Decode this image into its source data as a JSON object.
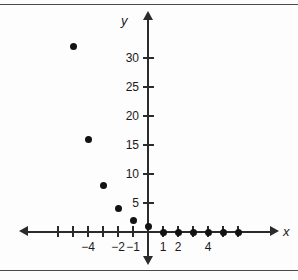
{
  "figure": {
    "x_axis_label": "x",
    "y_axis_label": "y",
    "background_color": "#fdfdfd",
    "point_color": "#121212",
    "axis_color": "#2b2b2b"
  },
  "chart_data": {
    "type": "scatter",
    "title": "",
    "xlabel": "x",
    "ylabel": "y",
    "grid": false,
    "legend": null,
    "xlim": [
      -7,
      7
    ],
    "ylim": [
      -2,
      34
    ],
    "x_tick_values": [
      -6,
      -5,
      -4,
      -3,
      -2,
      -1,
      1,
      2,
      3,
      4,
      5,
      6
    ],
    "x_tick_labels": [
      "",
      "",
      "-4",
      "",
      "-2",
      "-1",
      "1",
      "2",
      "",
      "4",
      "",
      ""
    ],
    "x_labeled_ticks": [
      {
        "value": -4,
        "label": "−4"
      },
      {
        "value": -2,
        "label": "−2"
      },
      {
        "value": -1,
        "label": "−1"
      },
      {
        "value": 1,
        "label": "1"
      },
      {
        "value": 2,
        "label": "2"
      },
      {
        "value": 4,
        "label": "4"
      }
    ],
    "y_tick_values": [
      5,
      10,
      15,
      20,
      25,
      30
    ],
    "y_tick_labels": [
      "5",
      "10",
      "15",
      "20",
      "25",
      "30"
    ],
    "points": [
      {
        "x": -5,
        "y": 32
      },
      {
        "x": -4,
        "y": 16
      },
      {
        "x": -3,
        "y": 8
      },
      {
        "x": -2,
        "y": 4
      },
      {
        "x": -1,
        "y": 2
      },
      {
        "x": 0,
        "y": 1
      },
      {
        "x": 1,
        "y": 0
      },
      {
        "x": 2,
        "y": 0
      },
      {
        "x": 3,
        "y": 0
      },
      {
        "x": 4,
        "y": 0
      },
      {
        "x": 5,
        "y": 0
      },
      {
        "x": 6,
        "y": 0
      }
    ]
  }
}
